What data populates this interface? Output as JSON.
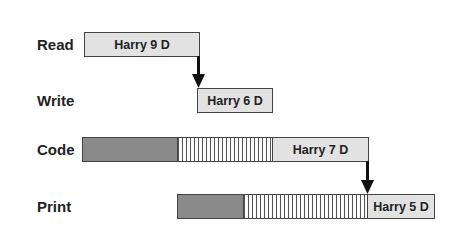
{
  "diagram": {
    "rows": [
      {
        "label": "Read",
        "segments": [
          {
            "type": "task",
            "text": "Harry 9 D"
          }
        ]
      },
      {
        "label": "Write",
        "segments": [
          {
            "type": "task",
            "text": "Harry 6 D"
          }
        ]
      },
      {
        "label": "Code",
        "segments": [
          {
            "type": "busy"
          },
          {
            "type": "wait"
          },
          {
            "type": "task",
            "text": "Harry 7 D"
          }
        ]
      },
      {
        "label": "Print",
        "segments": [
          {
            "type": "busy"
          },
          {
            "type": "wait"
          },
          {
            "type": "task",
            "text": "Harry 5 D"
          }
        ]
      }
    ],
    "arrows": [
      {
        "from": "Read",
        "to": "Write"
      },
      {
        "from": "Code",
        "to": "Print"
      }
    ],
    "colors": {
      "task": "#e2e2e2",
      "busy": "#8a8a8a",
      "outline": "#444444"
    }
  }
}
